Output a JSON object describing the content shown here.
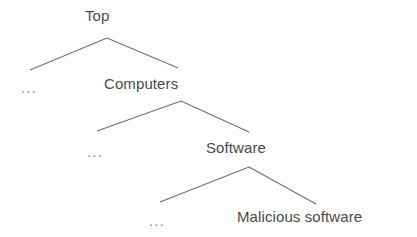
{
  "diagram": {
    "kind": "hierarchy-tree",
    "background_color": "#ffffff",
    "edge_color": "#6f6f6f",
    "label_color": "#4a4a4a",
    "ellipsis_color": "#8a8a8a",
    "nodes": [
      {
        "id": "top",
        "label": "Top",
        "x": 85,
        "y": 7,
        "level": 0
      },
      {
        "id": "ellipsis1",
        "label": "...",
        "x": 21,
        "y": 79,
        "level": 1
      },
      {
        "id": "computers",
        "label": "Computers",
        "x": 104,
        "y": 75,
        "level": 1
      },
      {
        "id": "ellipsis2",
        "label": "...",
        "x": 87,
        "y": 143,
        "level": 2
      },
      {
        "id": "software",
        "label": "Software",
        "x": 206,
        "y": 139,
        "level": 2
      },
      {
        "id": "ellipsis3",
        "label": "...",
        "x": 149,
        "y": 212,
        "level": 3
      },
      {
        "id": "malware",
        "label": "Malicious software",
        "x": 237,
        "y": 208,
        "level": 3
      }
    ],
    "edges": [
      {
        "id": "edge-top-left",
        "from": "top",
        "to": "ellipsis1",
        "points": "30,70 107,38"
      },
      {
        "id": "edge-top-right",
        "from": "top",
        "to": "computers",
        "points": "107,38 178,68"
      },
      {
        "id": "edge-computers-left",
        "from": "computers",
        "to": "ellipsis2",
        "points": "97,131 181,101"
      },
      {
        "id": "edge-computers-right",
        "from": "computers",
        "to": "software",
        "points": "181,101 249,132"
      },
      {
        "id": "edge-software-left",
        "from": "software",
        "to": "ellipsis3",
        "points": "160,202 249,167"
      },
      {
        "id": "edge-software-right",
        "from": "software",
        "to": "malware",
        "points": "249,167 316,204"
      }
    ]
  }
}
